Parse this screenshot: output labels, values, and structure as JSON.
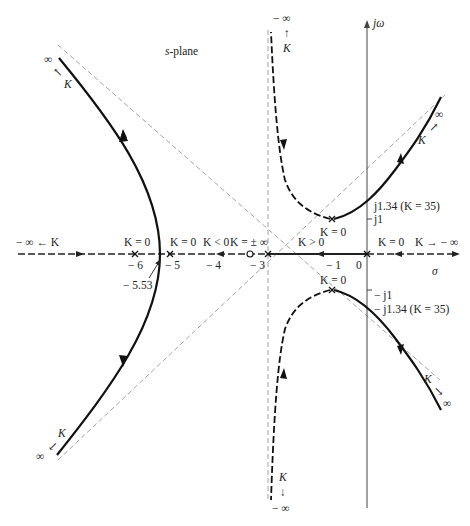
{
  "diagram": {
    "title": "s-plane",
    "title_italic_part": "s",
    "title_rest": "-plane",
    "axes": {
      "imag_label": "jω",
      "real_label": "σ"
    },
    "real_axis_ticks": [
      "− 6",
      "− 5",
      "− 4",
      "− 3",
      "− 1",
      "0"
    ],
    "breakaway_label": "− 5.53",
    "imag_ticks": {
      "j1": "j1",
      "neg_j1": "− j1",
      "j134": "j1.34 (K = 35)",
      "neg_j134": "− j1.34 (K = 35)"
    },
    "annotations": {
      "k0_left_pole": "K = 0",
      "k0_pole5": "K = 0",
      "k_lt0": "K < 0",
      "k_pm_inf": "K = ± ∞",
      "k_gt0": "K > 0",
      "k0_origin": "K = 0",
      "k_to_neg_inf": "K → − ∞",
      "neg_inf_left": "− ∞ ← K",
      "k0_upper": "K = 0",
      "k0_lower": "K = 0",
      "top_neg_inf": "− ∞",
      "top_arrow": "↑",
      "top_K": "K",
      "bottom_neg_inf": "− ∞",
      "bottom_arrow": "↓",
      "bottom_K": "K",
      "ul_inf": "∞",
      "ul_arrow": "↖",
      "ul_K": "K",
      "ur_inf": "∞",
      "ur_arrow": "↗",
      "ur_K": "K",
      "ll_inf": "∞",
      "ll_arrow": "↙",
      "ll_K": "K",
      "lr_inf": "∞",
      "lr_arrow": "↘",
      "lr_K": "K"
    },
    "poles": [
      {
        "sigma": 0,
        "omega": 0
      },
      {
        "sigma": -5,
        "omega": 0
      },
      {
        "sigma": -6,
        "omega": 0
      },
      {
        "sigma": -1,
        "omega": 1
      },
      {
        "sigma": -1,
        "omega": -1
      }
    ],
    "zeros": [
      {
        "sigma": -3,
        "omega": 0
      }
    ],
    "asymptote_centroid": -3,
    "crossing": {
      "omega": 1.34,
      "K": 35
    },
    "breakaway": -5.53,
    "colors": {
      "ink": "#222222",
      "asymptote": "#888888"
    }
  }
}
